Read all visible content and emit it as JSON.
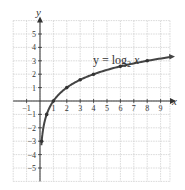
{
  "chart_data": {
    "type": "line",
    "title": "",
    "annotation": {
      "text_main": "y = log",
      "subscript": "2",
      "text_tail": " x"
    },
    "xlabel": "x",
    "ylabel": "y",
    "xlim": [
      -2,
      9.7
    ],
    "ylim": [
      -6,
      6
    ],
    "grid": true,
    "x_ticks": [
      -1,
      1,
      2,
      3,
      4,
      5,
      6,
      7,
      8,
      9
    ],
    "y_ticks": [
      -5,
      -4,
      -3,
      -2,
      -1,
      1,
      2,
      3,
      4,
      5
    ],
    "series": [
      {
        "name": "y = log2 x",
        "function": "log2(x)",
        "marked_points": [
          {
            "x": 0.125,
            "y": -3
          },
          {
            "x": 0.5,
            "y": -1
          },
          {
            "x": 1,
            "y": 0
          },
          {
            "x": 2,
            "y": 1
          },
          {
            "x": 3,
            "y": 1.585
          },
          {
            "x": 4,
            "y": 2
          },
          {
            "x": 6,
            "y": 2.585
          },
          {
            "x": 8,
            "y": 3
          }
        ],
        "color": "#444444"
      }
    ]
  }
}
